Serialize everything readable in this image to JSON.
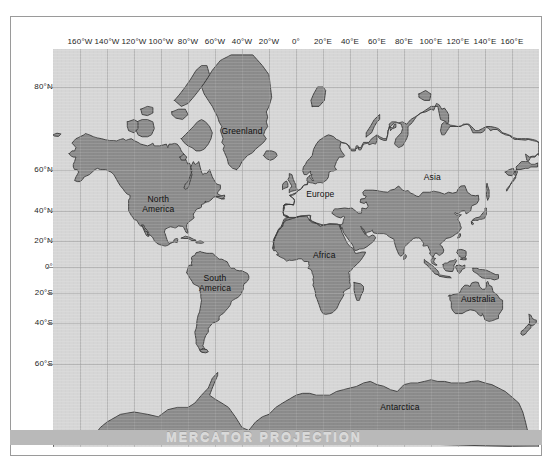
{
  "figure": {
    "caption": "MERCATOR PROJECTION",
    "ghost_text": "",
    "colors": {
      "ocean": "#d6d6d6",
      "land": "#8b8b8b",
      "coastline": "#3a3a3a",
      "graticule": "#9d9d9d",
      "frame": "#9a9a9a",
      "caption_band": "#b9b9b9",
      "caption_text": "#d9d9d9",
      "label_text": "#111111"
    }
  },
  "axes": {
    "longitude": {
      "unit": "degrees",
      "ticks": [
        {
          "label": "160°W",
          "value": -160
        },
        {
          "label": "140°W",
          "value": -140
        },
        {
          "label": "120°W",
          "value": -120
        },
        {
          "label": "100°W",
          "value": -100
        },
        {
          "label": "80°W",
          "value": -80
        },
        {
          "label": "60°W",
          "value": -60
        },
        {
          "label": "40°W",
          "value": -40
        },
        {
          "label": "20°W",
          "value": -20
        },
        {
          "label": "0°",
          "value": 0
        },
        {
          "label": "20°E",
          "value": 20
        },
        {
          "label": "40°E",
          "value": 40
        },
        {
          "label": "60°E",
          "value": 60
        },
        {
          "label": "80°E",
          "value": 80
        },
        {
          "label": "100°E",
          "value": 100
        },
        {
          "label": "120°E",
          "value": 120
        },
        {
          "label": "140°E",
          "value": 140
        },
        {
          "label": "160°E",
          "value": 160
        }
      ],
      "range": [
        -180,
        180
      ]
    },
    "latitude": {
      "unit": "degrees",
      "ticks": [
        {
          "label": "80°N",
          "value": 80
        },
        {
          "label": "60°N",
          "value": 60
        },
        {
          "label": "40°N",
          "value": 40
        },
        {
          "label": "20°N",
          "value": 20
        },
        {
          "label": "0°",
          "value": 0
        },
        {
          "label": "20°S",
          "value": -20
        },
        {
          "label": "40°S",
          "value": -40
        },
        {
          "label": "60°S",
          "value": -60
        }
      ],
      "range": [
        -80,
        84
      ]
    }
  },
  "map_labels": [
    {
      "name": "greenland",
      "text": "Greenland",
      "lon": -40,
      "lat": 72
    },
    {
      "name": "north-america",
      "text": "North\nAmerica",
      "lon": -102,
      "lat": 44
    },
    {
      "name": "south-america",
      "text": "South\nAmerica",
      "lon": -60,
      "lat": -12
    },
    {
      "name": "europe",
      "text": "Europe",
      "lon": 18,
      "lat": 49
    },
    {
      "name": "africa",
      "text": "Africa",
      "lon": 21,
      "lat": 9
    },
    {
      "name": "asia",
      "text": "Asia",
      "lon": 101,
      "lat": 57
    },
    {
      "name": "australia",
      "text": "Australia",
      "lon": 135,
      "lat": -24
    },
    {
      "name": "antarctica",
      "text": "Antarctica",
      "lon": 77,
      "lat": -73
    }
  ]
}
